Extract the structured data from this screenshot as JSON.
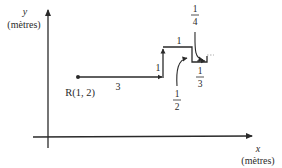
{
  "diagram": {
    "y_axis": {
      "var": "y",
      "unit": "(mètres)"
    },
    "x_axis": {
      "var": "x",
      "unit": "(mètres)"
    },
    "start_point": {
      "label": "R(1, 2)"
    },
    "segments": [
      {
        "label": "3",
        "direction": "right"
      },
      {
        "label": "1",
        "direction": "up"
      },
      {
        "label": "1",
        "direction": "right"
      }
    ],
    "fractions": [
      {
        "num": "1",
        "den": "4"
      },
      {
        "num": "1",
        "den": "2"
      },
      {
        "num": "1",
        "den": "3"
      }
    ],
    "colors": {
      "line": "#2a2a2a",
      "background": "#ffffff"
    }
  }
}
